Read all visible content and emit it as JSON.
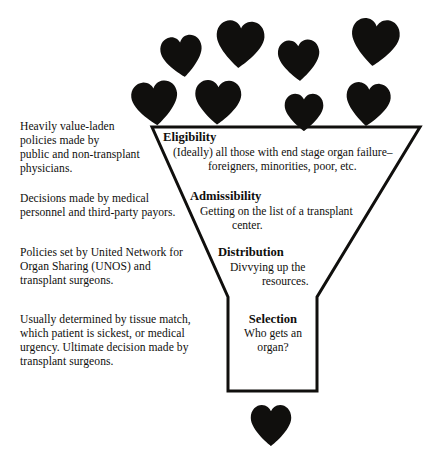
{
  "figure": {
    "ink_color": "#100f0d",
    "background_color": "#ffffff",
    "heart_color": "#100f0d"
  },
  "left_notes": [
    "Heavily value-laden\npolicies made by\npublic and non-transplant\nphysicians.",
    "Decisions made by medical\npersonnel and third-party payors.",
    "Policies set by United Network for\nOrgan Sharing (UNOS) and\ntransplant surgeons.",
    "Usually determined by tissue match,\nwhich patient is sickest, or medical\nurgency.  Ultimate decision made by\ntransplant surgeons."
  ],
  "stages": [
    {
      "title": "Eligibility",
      "desc_line1": "(Ideally) all those with end stage organ failure–",
      "desc_line2": "foreigners, minorities, poor, etc."
    },
    {
      "title": "Admissibility",
      "desc_line1": "Getting on the list of a transplant",
      "desc_line2": "center."
    },
    {
      "title": "Distribution",
      "desc_line1": "Divvying up the",
      "desc_line2": "resources."
    },
    {
      "title": "Selection",
      "desc_line1": "Who gets an",
      "desc_line2": "organ?"
    }
  ],
  "hearts": {
    "input_row_upper": [
      {
        "cx": 182,
        "cy": 56,
        "w": 45,
        "h": 42,
        "rot": -8
      },
      {
        "cx": 240,
        "cy": 44,
        "w": 52,
        "h": 48,
        "rot": 4
      },
      {
        "cx": 299,
        "cy": 60,
        "w": 45,
        "h": 42,
        "rot": -3
      },
      {
        "cx": 375,
        "cy": 42,
        "w": 52,
        "h": 48,
        "rot": 6
      }
    ],
    "input_row_lower": [
      {
        "cx": 155,
        "cy": 103,
        "w": 50,
        "h": 45,
        "rot": -6
      },
      {
        "cx": 218,
        "cy": 102,
        "w": 50,
        "h": 45,
        "rot": 2
      },
      {
        "cx": 304,
        "cy": 112,
        "w": 42,
        "h": 38,
        "rot": 0
      },
      {
        "cx": 368,
        "cy": 104,
        "w": 48,
        "h": 44,
        "rot": 5
      }
    ],
    "output": [
      {
        "cx": 271,
        "cy": 425,
        "w": 44,
        "h": 42,
        "rot": 0
      }
    ]
  },
  "funnel": {
    "stroke_width": 3,
    "top_left_x": 152,
    "top_right_x": 420,
    "top_y": 127,
    "neck_left_x": 228,
    "neck_right_x": 317,
    "neck_top_y": 297,
    "neck_bottom_y": 391
  }
}
